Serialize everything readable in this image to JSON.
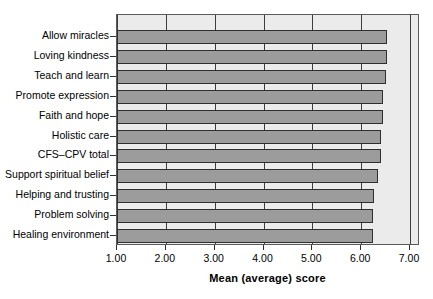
{
  "chart_data": {
    "type": "bar",
    "orientation": "horizontal",
    "title": "",
    "xlabel": "Mean (average) score",
    "ylabel": "",
    "xlim": [
      1.0,
      7.0
    ],
    "xticks": [
      "1.00",
      "2.00",
      "3.00",
      "4.00",
      "5.00",
      "6.00",
      "7.00"
    ],
    "xtick_values": [
      1.0,
      2.0,
      3.0,
      4.0,
      5.0,
      6.0,
      7.0
    ],
    "grid": true,
    "legend": "none",
    "bar_fill_color": "#9c9c9c",
    "bar_border_color": "#2f2f2f",
    "panel_background": "#ebebeb",
    "categories": [
      "Allow miracles",
      "Loving kindness",
      "Teach and learn",
      "Promote expression",
      "Faith and hope",
      "Holistic care",
      "CFS–CPV total",
      "Support spiritual belief",
      "Helping and trusting",
      "Problem solving",
      "Healing environment"
    ],
    "values": [
      6.5,
      6.5,
      6.48,
      6.42,
      6.42,
      6.38,
      6.38,
      6.33,
      6.25,
      6.22,
      6.22
    ]
  }
}
